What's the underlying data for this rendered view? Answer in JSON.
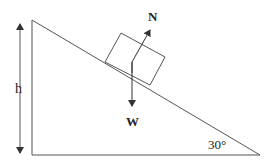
{
  "diagram": {
    "labels": {
      "height": "h",
      "normal_force": "N",
      "weight": "W",
      "angle": "30°"
    },
    "colors": {
      "line": "#555555",
      "arrow": "#333333",
      "text": "#222222",
      "background": "#ffffff"
    }
  }
}
